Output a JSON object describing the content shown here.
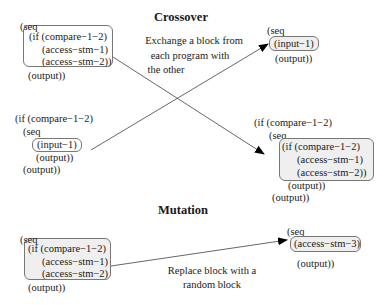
{
  "sections": {
    "crossover": {
      "title": "Crossover",
      "caption": [
        "Exchange a block from",
        "each program with",
        "the other"
      ]
    },
    "mutation": {
      "title": "Mutation",
      "caption": [
        "Replace block with a",
        "random block"
      ]
    }
  },
  "programs": {
    "parent1": {
      "lines": [
        "(seq",
        "(if (compare−1−2)",
        "(access−stm−1)",
        "(access−stm−2))",
        "(output))"
      ],
      "highlighted_block": "(if (compare-1-2) (access-stm-1) (access-stm-2))"
    },
    "parent2": {
      "lines": [
        "(if (compare−1−2)",
        "(seq",
        "(input−1)",
        "(output))",
        "(output))"
      ],
      "highlighted_block": "(input-1)"
    },
    "child1": {
      "lines": [
        "(seq",
        "(input−1)",
        "(output))"
      ],
      "highlighted_block": "(input-1)"
    },
    "child2": {
      "lines": [
        "(if (compare−1−2)",
        "(seq",
        "(if (compare−1−2)",
        "(access−stm−1)",
        "(access−stm−2))",
        "(output))",
        "(output))"
      ],
      "highlighted_block": "(if (compare-1-2) (access-stm-1) (access-stm-2))"
    },
    "mutation_parent": {
      "lines": [
        "(seq",
        "(if (compare−1−2)",
        "(access−stm−1)",
        "(access−stm−2)",
        "(output))"
      ],
      "highlighted_block": "(if (compare-1-2) (access-stm-1) (access-stm-2)"
    },
    "mutation_child": {
      "lines": [
        "(seq",
        "(access−stm−3)",
        "(output))"
      ],
      "highlighted_block": "(access-stm-3)"
    }
  },
  "arrows": [
    {
      "from": "parent1.block",
      "to": "child2.block"
    },
    {
      "from": "parent2.block",
      "to": "child1.block"
    },
    {
      "from": "mutation_parent.block",
      "to": "mutation_child.block"
    }
  ],
  "colors": {
    "box_border": "#777777",
    "box_fill_gray": "#efefef",
    "line": "#555555",
    "arrowhead": "#000000"
  }
}
